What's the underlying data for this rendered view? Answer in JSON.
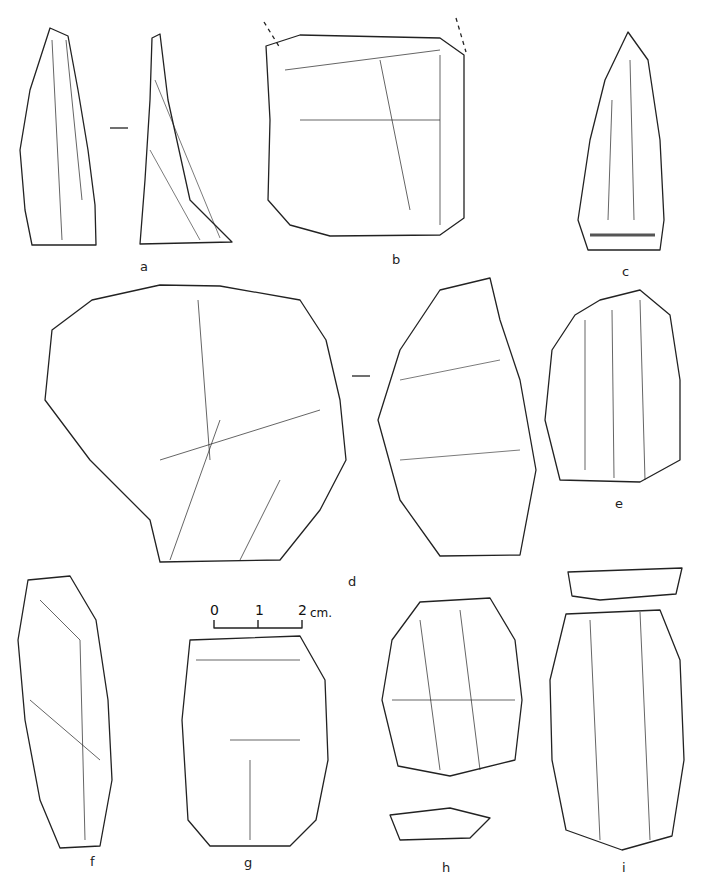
{
  "figure": {
    "labels": [
      {
        "id": "a",
        "text": "a",
        "x": 140,
        "y": 260
      },
      {
        "id": "b",
        "text": "b",
        "x": 392,
        "y": 253
      },
      {
        "id": "c",
        "text": "c",
        "x": 622,
        "y": 265
      },
      {
        "id": "d",
        "text": "d",
        "x": 348,
        "y": 575
      },
      {
        "id": "e",
        "text": "e",
        "x": 615,
        "y": 497
      },
      {
        "id": "f",
        "text": "f",
        "x": 90,
        "y": 855
      },
      {
        "id": "g",
        "text": "g",
        "x": 244,
        "y": 856
      },
      {
        "id": "h",
        "text": "h",
        "x": 442,
        "y": 861
      },
      {
        "id": "i",
        "text": "i",
        "x": 622,
        "y": 861
      }
    ],
    "scale_bar": {
      "zero": "0",
      "one": "1",
      "two": "2",
      "unit": "cm."
    }
  }
}
